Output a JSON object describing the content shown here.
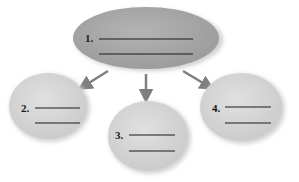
{
  "diagram": {
    "type": "concept-map",
    "colors": {
      "main_fill": "#a8a8a8",
      "child_fill": "#d6d6d6",
      "arrow": "#7f7f7f",
      "blank_line": "#1a1a1a",
      "shadow": "#c4c4c4"
    },
    "nodes": [
      {
        "id": "1",
        "label": "1.",
        "blank_lines": 2,
        "role": "main"
      },
      {
        "id": "2",
        "label": "2.",
        "blank_lines": 2,
        "role": "child"
      },
      {
        "id": "3",
        "label": "3.",
        "blank_lines": 2,
        "role": "child"
      },
      {
        "id": "4",
        "label": "4.",
        "blank_lines": 2,
        "role": "child"
      }
    ],
    "edges": [
      {
        "from": "1",
        "to": "2"
      },
      {
        "from": "1",
        "to": "3"
      },
      {
        "from": "1",
        "to": "4"
      }
    ]
  }
}
